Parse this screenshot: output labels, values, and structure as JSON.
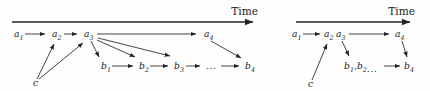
{
  "figure": {
    "kind": "two-panel event-timeline diagram",
    "colors": {
      "ink": "#232323",
      "background": "#fefefe"
    },
    "left_panel": {
      "axis": {
        "label": "Time",
        "direction": "left-to-right"
      },
      "nodes": {
        "a1": {
          "base": "a",
          "sub": "1"
        },
        "a2": {
          "base": "a",
          "sub": "2"
        },
        "a3": {
          "base": "a",
          "sub": "3"
        },
        "a4": {
          "base": "a",
          "sub": "4"
        },
        "b1": {
          "base": "b",
          "sub": "1"
        },
        "b2": {
          "base": "b",
          "sub": "2"
        },
        "b3": {
          "base": "b",
          "sub": "3"
        },
        "b4": {
          "base": "b",
          "sub": "4"
        },
        "ellipsis": {
          "base": "..."
        },
        "c": {
          "base": "c"
        }
      },
      "edges": [
        "a1->a2",
        "a2->a3",
        "a3->a4",
        "a3->b1",
        "a3->b2",
        "a3->b3",
        "b1->b2",
        "b2->b3",
        "b3->ellipsis",
        "ellipsis->b4",
        "a4->b4",
        "c->a2",
        "c->a3"
      ]
    },
    "right_panel": {
      "axis": {
        "label": "Time",
        "direction": "left-to-right"
      },
      "nodes": {
        "a1": {
          "base": "a",
          "sub": "1"
        },
        "a2": {
          "base": "a",
          "sub": "2"
        },
        "a3": {
          "base": "a",
          "sub": "3"
        },
        "a4": {
          "base": "a",
          "sub": "4"
        },
        "bgroup": {
          "b1_base": "b",
          "b1_sub": "1",
          "comma": ",",
          "b2_base": "b",
          "b2_sub": "2",
          "ellipsis": "..."
        },
        "b4": {
          "base": "b",
          "sub": "4"
        },
        "c": {
          "base": "c"
        }
      },
      "edges": [
        "a1->a2",
        "a3->a4",
        "a3->bgroup",
        "bgroup->b4",
        "a4->b4",
        "c->a2"
      ]
    }
  }
}
